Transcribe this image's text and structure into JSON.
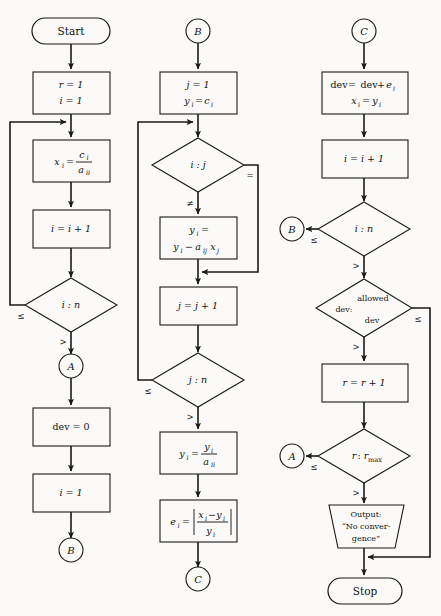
{
  "diagram": {
    "background_color": "#fbfaf8",
    "line_color": "#1a1a1a",
    "columns": 3
  },
  "column_left": {
    "start": {
      "label": "Start",
      "shape": "terminal"
    },
    "init": {
      "line1": "r = 1",
      "line2": "i = 1",
      "shape": "process"
    },
    "assign_x": {
      "text": "x_i = c_i / a_ii",
      "lhs": "x",
      "lhs_sub": "i",
      "eq": "=",
      "num": "c",
      "num_sub": "i",
      "den": "a",
      "den_sub": "ii",
      "shape": "process"
    },
    "incr_i": {
      "text": "i = i + 1",
      "shape": "process"
    },
    "test_in": {
      "text": "i : n",
      "left_label": "≤",
      "bottom_label": ">",
      "shape": "decision"
    },
    "conn_a": {
      "label": "A",
      "shape": "connector"
    },
    "dev_zero": {
      "text": "dev = 0",
      "shape": "process"
    },
    "set_i": {
      "text": "i = 1",
      "shape": "process"
    },
    "conn_b_out": {
      "label": "B",
      "shape": "connector"
    }
  },
  "column_middle": {
    "conn_b_in": {
      "label": "B",
      "shape": "connector"
    },
    "init_j": {
      "line1": "j = 1",
      "line2": "y_i = c_i",
      "shape": "process"
    },
    "test_ij": {
      "text": "i : j",
      "right_label": "=",
      "bottom_label": "≠",
      "shape": "decision"
    },
    "update_y": {
      "line1": "y_i =",
      "line2": "y_i - a_ij x_j",
      "shape": "process"
    },
    "incr_j": {
      "text": "j = j + 1",
      "shape": "process"
    },
    "test_jn": {
      "text": "j : n",
      "left_label": "≤",
      "bottom_label": ">",
      "shape": "decision"
    },
    "divide_y": {
      "text": "y_i = y_i / a_ii",
      "shape": "process"
    },
    "error": {
      "text": "e_i = | (x_i - y_i) / y_i |",
      "shape": "process"
    },
    "conn_c_out": {
      "label": "C",
      "shape": "connector"
    }
  },
  "column_right": {
    "conn_c_in": {
      "label": "C",
      "shape": "connector"
    },
    "accumulate": {
      "line1": "dev = dev + e_i",
      "line2": "x_i = y_i",
      "shape": "process"
    },
    "incr_i": {
      "text": "i = i + 1",
      "shape": "process"
    },
    "test_in": {
      "text": "i : n",
      "left_label": "≤",
      "bottom_label": ">",
      "shape": "decision"
    },
    "conn_b_target": {
      "label": "B",
      "shape": "connector"
    },
    "test_dev": {
      "line1": "allowed",
      "line2": "dev:",
      "line3": "dev",
      "right_label": "≤",
      "bottom_label": ">",
      "shape": "decision"
    },
    "incr_r": {
      "text": "r = r + 1",
      "shape": "process"
    },
    "test_rmax": {
      "text": "r : r_max",
      "left_label": "≤",
      "bottom_label": ">",
      "shape": "decision"
    },
    "conn_a_target": {
      "label": "A",
      "shape": "connector"
    },
    "output": {
      "line1": "Output:",
      "line2": "“No conver-",
      "line3": "gence”",
      "shape": "output"
    },
    "stop": {
      "label": "Stop",
      "shape": "terminal"
    }
  }
}
